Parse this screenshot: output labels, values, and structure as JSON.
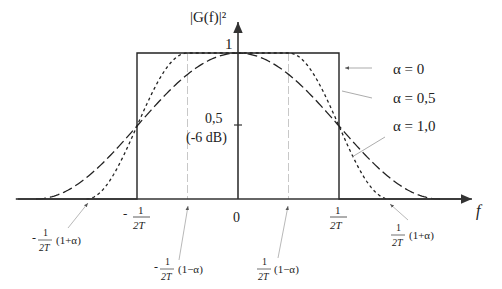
{
  "chart_data": {
    "type": "line",
    "title": "",
    "ylabel": "|G(f)|²",
    "xlabel": "f",
    "xlim_in_units_of_1_over_2T": [
      -2.2,
      2.35
    ],
    "ylim": [
      0,
      1.18
    ],
    "y_ticks": [
      {
        "value": 1,
        "label": "1"
      },
      {
        "value": 0.5,
        "label": "0,5",
        "sublabel": "(-6 dB)"
      }
    ],
    "x_ticks": [
      {
        "value": -1,
        "label_prefix": "-",
        "num": "1",
        "den": "2T"
      },
      {
        "value": 0,
        "label": "0"
      },
      {
        "value": 1,
        "label_prefix": "",
        "num": "1",
        "den": "2T"
      }
    ],
    "guide_lines_at": [
      -0.5,
      0.5
    ],
    "series": [
      {
        "name": "α = 0",
        "alpha": 0,
        "style": "solid"
      },
      {
        "name": "α = 0,5",
        "alpha": 0.5,
        "style": "short-dash"
      },
      {
        "name": "α = 1,0",
        "alpha": 1.0,
        "style": "long-dash"
      }
    ],
    "annotations": [
      {
        "id": "neg-one-plus-alpha",
        "sign": "-",
        "num": "1",
        "den": "2T",
        "factor": "(1+α)",
        "points_to": -1.5
      },
      {
        "id": "neg-one-minus-alpha",
        "sign": "-",
        "num": "1",
        "den": "2T",
        "factor": "(1−α)",
        "points_to": -0.5
      },
      {
        "id": "pos-one-minus-alpha",
        "sign": "",
        "num": "1",
        "den": "2T",
        "factor": "(1−α)",
        "points_to": 0.5
      },
      {
        "id": "pos-one-plus-alpha",
        "sign": "",
        "num": "1",
        "den": "2T",
        "factor": "(1+α)",
        "points_to": 1.5
      }
    ]
  }
}
